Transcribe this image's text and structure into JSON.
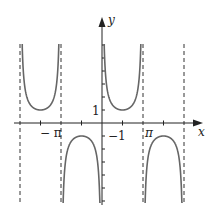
{
  "chart_data": {
    "type": "line",
    "function": "y = csc(x)",
    "title": "",
    "xlabel": "x",
    "ylabel": "y",
    "x_tick_labels": [
      "-π",
      "π"
    ],
    "y_tick_labels": [
      "1",
      "-1"
    ],
    "xlim": [
      -4.0,
      4.7
    ],
    "ylim": [
      -6.2,
      6.0
    ],
    "asymptotes": [
      "-3π/2",
      "-π",
      "0",
      "π",
      "2π"
    ],
    "asymptotes_display": [
      -6.283,
      -3.1416,
      0,
      3.1416,
      6.283
    ],
    "local_extrema": [
      {
        "x": -4.712,
        "y": 1,
        "kind": "min"
      },
      {
        "x": -1.571,
        "y": -1,
        "kind": "max"
      },
      {
        "x": 1.571,
        "y": 1,
        "kind": "min"
      },
      {
        "x": 4.712,
        "y": -1,
        "kind": "max"
      }
    ],
    "grid": false,
    "legend": null
  },
  "labels": {
    "x_axis": "x",
    "y_axis": "y",
    "neg_pi": "− π",
    "pi": "π",
    "one": "1",
    "neg_one": "−1"
  },
  "colors": {
    "curve": "#666666",
    "axis": "#222222",
    "asymptote": "#333333"
  }
}
